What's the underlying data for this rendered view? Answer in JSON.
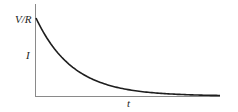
{
  "figure": {
    "y_top_label": "V/R",
    "y_axis_label": "I",
    "x_axis_label": "t",
    "colors": {
      "curve": "#1e1e1e",
      "axis": "#8a8a8a",
      "background": "#ffffff"
    }
  },
  "chart_data": {
    "type": "line",
    "title": "",
    "xlabel": "t",
    "ylabel": "I",
    "y_annotations": [
      {
        "label": "V/R",
        "y": 1.0
      }
    ],
    "x": [
      0,
      0.5,
      1,
      1.5,
      2,
      2.5,
      3,
      3.5,
      4,
      4.5,
      5
    ],
    "series": [
      {
        "name": "I(t) = (V/R) e^(-t/RC)",
        "values": [
          1.0,
          0.607,
          0.368,
          0.223,
          0.135,
          0.082,
          0.05,
          0.03,
          0.018,
          0.011,
          0.007
        ]
      }
    ],
    "grid": false,
    "legend": false
  }
}
